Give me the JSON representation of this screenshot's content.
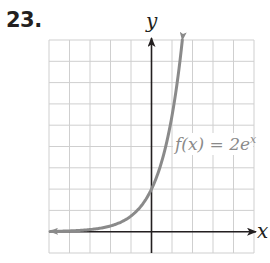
{
  "problem": {
    "number": "23."
  },
  "chart_data": {
    "type": "line",
    "title": "",
    "xlabel": "x",
    "ylabel": "y",
    "xlim": [
      -5,
      5
    ],
    "ylim": [
      -1,
      9
    ],
    "grid": true,
    "grid_step": 1,
    "tick_labels": false,
    "series": [
      {
        "name": "f(x) = 2e^x",
        "function": "2*exp(x)",
        "color": "#8a8a8a",
        "x": [
          -5,
          -4,
          -3,
          -2,
          -1,
          0,
          0.5,
          1,
          1.5
        ],
        "values": [
          0.013,
          0.037,
          0.1,
          0.27,
          0.74,
          2,
          3.3,
          5.44,
          8.96
        ]
      }
    ],
    "annotations": [
      {
        "text_main": "f(x) = 2e",
        "text_sup": "x",
        "x": 1.1,
        "y": 4.0
      }
    ]
  },
  "colors": {
    "grid": "#cfcfcf",
    "axis": "#231f20",
    "curve": "#8a8a8a",
    "label": "#8a8a8a"
  }
}
